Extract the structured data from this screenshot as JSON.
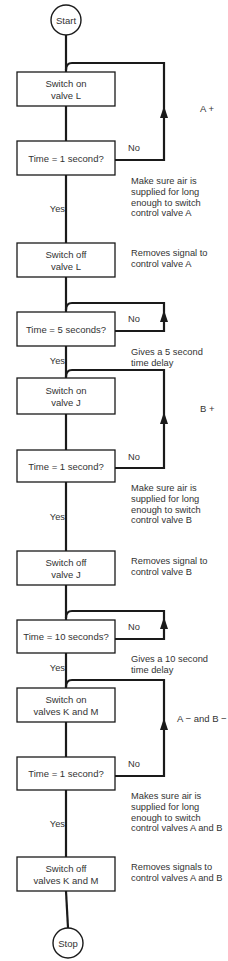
{
  "terminals": {
    "start": "Start",
    "stop": "Stop"
  },
  "steps": [
    {
      "lines": [
        "Switch on",
        "valve L"
      ]
    },
    {
      "lines": [
        "Time  =  1 second?"
      ],
      "no_label": "No",
      "yes_label": "Yes",
      "note": [
        "Make sure air is",
        "supplied for long",
        "enough to switch",
        "control valve A"
      ]
    },
    {
      "lines": [
        "Switch off",
        "valve L"
      ],
      "note": [
        "Removes signal to",
        "control valve A"
      ]
    },
    {
      "lines": [
        "Time  =  5 seconds?"
      ],
      "no_label": "No",
      "yes_label": "Yes",
      "note": [
        "Gives a 5 second",
        "time delay"
      ]
    },
    {
      "lines": [
        "Switch on",
        "valve J"
      ]
    },
    {
      "lines": [
        "Time  =  1 second?"
      ],
      "no_label": "No",
      "yes_label": "Yes",
      "note": [
        "Make sure air is",
        "supplied for long",
        "enough to switch",
        "control valve B"
      ]
    },
    {
      "lines": [
        "Switch off",
        "valve J"
      ],
      "note": [
        "Removes signal to",
        "control valve B"
      ]
    },
    {
      "lines": [
        "Time  =  10 seconds?"
      ],
      "no_label": "No",
      "yes_label": "Yes",
      "note": [
        "Gives a 10 second",
        "time delay"
      ]
    },
    {
      "lines": [
        "Switch on",
        "valves K and M"
      ]
    },
    {
      "lines": [
        "Time  =  1 second?"
      ],
      "no_label": "No",
      "yes_label": "Yes",
      "note": [
        "Makes sure air is",
        "supplied for long",
        "enough to switch",
        "control valves A and B"
      ]
    },
    {
      "lines": [
        "Switch off",
        "valves K and M"
      ],
      "note": [
        "Removes signals to",
        "control valves A and B"
      ]
    }
  ],
  "phases": [
    {
      "label": "A +"
    },
    {
      "label": "B +"
    },
    {
      "label": "A −  and B −"
    }
  ]
}
